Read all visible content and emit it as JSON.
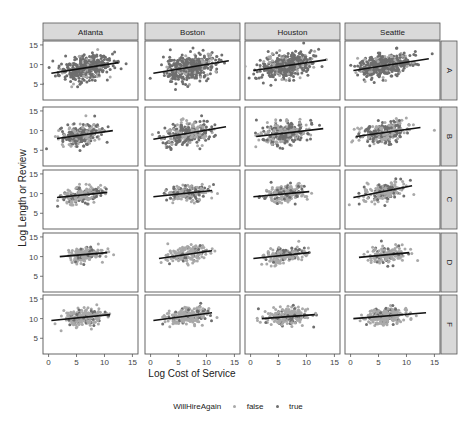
{
  "chart_data": {
    "type": "scatter",
    "facet_columns": [
      "Atlanta",
      "Boston",
      "Houston",
      "Seattle"
    ],
    "facet_rows": [
      "A",
      "B",
      "C",
      "D",
      "F"
    ],
    "xlabel": "Log Cost of Service",
    "ylabel": "Log Length or Review",
    "x_ticks": [
      0,
      5,
      10,
      15
    ],
    "y_ticks": [
      5,
      10,
      15
    ],
    "xlim": [
      -1,
      16
    ],
    "ylim": [
      1,
      16
    ],
    "legend": {
      "title": "WillHireAgain",
      "entries": [
        {
          "label": "false",
          "color": "#a9a9a9"
        },
        {
          "label": "true",
          "color": "#6e6e6e"
        }
      ],
      "position": "bottom"
    },
    "colors": {
      "false": "#a9a9a9",
      "true": "#6e6e6e",
      "fit_line": "#111111",
      "strip_bg": "#d9d9d9",
      "panel_border": "#555555"
    },
    "panels": [
      {
        "row": "A",
        "col": "Atlanta",
        "x_center": 6.5,
        "x_spread": 3.0,
        "y_center": 9.0,
        "y_spread": 2.5,
        "n": 420,
        "true_share": 0.85,
        "fit": {
          "x0": 0.5,
          "y0": 7.8,
          "x1": 12.5,
          "y1": 10.5
        }
      },
      {
        "row": "A",
        "col": "Boston",
        "x_center": 7.0,
        "x_spread": 3.0,
        "y_center": 9.0,
        "y_spread": 2.5,
        "n": 440,
        "true_share": 0.85,
        "fit": {
          "x0": 0.5,
          "y0": 7.8,
          "x1": 14.0,
          "y1": 11.0
        }
      },
      {
        "row": "A",
        "col": "Houston",
        "x_center": 6.5,
        "x_spread": 3.0,
        "y_center": 9.0,
        "y_spread": 2.5,
        "n": 440,
        "true_share": 0.85,
        "fit": {
          "x0": 0.5,
          "y0": 8.5,
          "x1": 13.5,
          "y1": 11.2
        }
      },
      {
        "row": "A",
        "col": "Seattle",
        "x_center": 6.0,
        "x_spread": 3.0,
        "y_center": 9.5,
        "y_spread": 2.3,
        "n": 420,
        "true_share": 0.85,
        "fit": {
          "x0": 0.5,
          "y0": 8.5,
          "x1": 14.0,
          "y1": 11.5
        }
      },
      {
        "row": "B",
        "col": "Atlanta",
        "x_center": 6.0,
        "x_spread": 2.5,
        "y_center": 9.0,
        "y_spread": 2.2,
        "n": 260,
        "true_share": 0.55,
        "fit": {
          "x0": 1.5,
          "y0": 8.0,
          "x1": 11.5,
          "y1": 10.0
        }
      },
      {
        "row": "B",
        "col": "Boston",
        "x_center": 6.5,
        "x_spread": 2.8,
        "y_center": 9.0,
        "y_spread": 2.4,
        "n": 300,
        "true_share": 0.55,
        "fit": {
          "x0": 0.5,
          "y0": 7.8,
          "x1": 13.5,
          "y1": 11.0
        }
      },
      {
        "row": "B",
        "col": "Houston",
        "x_center": 6.0,
        "x_spread": 2.8,
        "y_center": 9.0,
        "y_spread": 2.2,
        "n": 280,
        "true_share": 0.55,
        "fit": {
          "x0": 1.0,
          "y0": 8.5,
          "x1": 13.0,
          "y1": 10.5
        }
      },
      {
        "row": "B",
        "col": "Seattle",
        "x_center": 6.0,
        "x_spread": 2.8,
        "y_center": 9.0,
        "y_spread": 2.2,
        "n": 280,
        "true_share": 0.55,
        "fit": {
          "x0": 1.0,
          "y0": 8.5,
          "x1": 12.5,
          "y1": 10.8
        }
      },
      {
        "row": "C",
        "col": "Atlanta",
        "x_center": 6.0,
        "x_spread": 2.5,
        "y_center": 9.5,
        "y_spread": 1.8,
        "n": 180,
        "true_share": 0.3,
        "fit": {
          "x0": 1.5,
          "y0": 9.0,
          "x1": 10.5,
          "y1": 10.3
        }
      },
      {
        "row": "C",
        "col": "Boston",
        "x_center": 6.5,
        "x_spread": 2.5,
        "y_center": 9.5,
        "y_spread": 1.8,
        "n": 180,
        "true_share": 0.3,
        "fit": {
          "x0": 0.5,
          "y0": 9.2,
          "x1": 11.0,
          "y1": 10.8
        }
      },
      {
        "row": "C",
        "col": "Houston",
        "x_center": 6.0,
        "x_spread": 2.5,
        "y_center": 9.5,
        "y_spread": 1.8,
        "n": 180,
        "true_share": 0.3,
        "fit": {
          "x0": 0.5,
          "y0": 9.2,
          "x1": 10.5,
          "y1": 10.5
        }
      },
      {
        "row": "C",
        "col": "Seattle",
        "x_center": 6.0,
        "x_spread": 2.5,
        "y_center": 9.5,
        "y_spread": 1.8,
        "n": 180,
        "true_share": 0.3,
        "fit": {
          "x0": 0.5,
          "y0": 9.0,
          "x1": 11.0,
          "y1": 12.0
        }
      },
      {
        "row": "D",
        "col": "Atlanta",
        "x_center": 6.5,
        "x_spread": 2.3,
        "y_center": 10.0,
        "y_spread": 1.6,
        "n": 150,
        "true_share": 0.2,
        "fit": {
          "x0": 2.0,
          "y0": 10.0,
          "x1": 10.5,
          "y1": 11.0
        }
      },
      {
        "row": "D",
        "col": "Boston",
        "x_center": 6.5,
        "x_spread": 2.3,
        "y_center": 10.0,
        "y_spread": 1.6,
        "n": 160,
        "true_share": 0.2,
        "fit": {
          "x0": 1.5,
          "y0": 9.5,
          "x1": 11.0,
          "y1": 11.5
        }
      },
      {
        "row": "D",
        "col": "Houston",
        "x_center": 6.0,
        "x_spread": 2.5,
        "y_center": 10.0,
        "y_spread": 1.6,
        "n": 160,
        "true_share": 0.2,
        "fit": {
          "x0": 0.5,
          "y0": 9.5,
          "x1": 10.5,
          "y1": 11.0
        }
      },
      {
        "row": "D",
        "col": "Seattle",
        "x_center": 6.5,
        "x_spread": 2.3,
        "y_center": 10.0,
        "y_spread": 1.6,
        "n": 150,
        "true_share": 0.2,
        "fit": {
          "x0": 1.5,
          "y0": 9.8,
          "x1": 10.5,
          "y1": 11.0
        }
      },
      {
        "row": "F",
        "col": "Atlanta",
        "x_center": 6.5,
        "x_spread": 2.5,
        "y_center": 10.0,
        "y_spread": 1.7,
        "n": 220,
        "true_share": 0.15,
        "fit": {
          "x0": 0.5,
          "y0": 9.5,
          "x1": 11.0,
          "y1": 11.0
        }
      },
      {
        "row": "F",
        "col": "Boston",
        "x_center": 6.5,
        "x_spread": 2.5,
        "y_center": 10.0,
        "y_spread": 1.7,
        "n": 220,
        "true_share": 0.15,
        "fit": {
          "x0": 0.5,
          "y0": 9.5,
          "x1": 11.0,
          "y1": 11.5
        }
      },
      {
        "row": "F",
        "col": "Houston",
        "x_center": 6.5,
        "x_spread": 2.5,
        "y_center": 10.0,
        "y_spread": 1.7,
        "n": 220,
        "true_share": 0.15,
        "fit": {
          "x0": 2.0,
          "y0": 10.0,
          "x1": 11.5,
          "y1": 11.0
        }
      },
      {
        "row": "F",
        "col": "Seattle",
        "x_center": 6.5,
        "x_spread": 2.5,
        "y_center": 10.0,
        "y_spread": 1.7,
        "n": 220,
        "true_share": 0.15,
        "fit": {
          "x0": 0.5,
          "y0": 10.0,
          "x1": 13.5,
          "y1": 11.5
        }
      }
    ]
  }
}
